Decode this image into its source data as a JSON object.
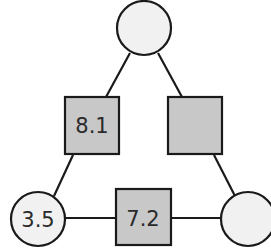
{
  "diagram": {
    "type": "triangle-number-puzzle",
    "circles": {
      "top": {
        "value": ""
      },
      "bottom_left": {
        "value": "3.5"
      },
      "bottom_right": {
        "value": ""
      }
    },
    "squares": {
      "left": {
        "value": "8.1"
      },
      "right": {
        "value": ""
      },
      "bottom": {
        "value": "7.2"
      }
    },
    "colors": {
      "circle_fill": "#f1f1f1",
      "square_fill": "#c8c8c8",
      "stroke": "#1a1a1a"
    }
  }
}
